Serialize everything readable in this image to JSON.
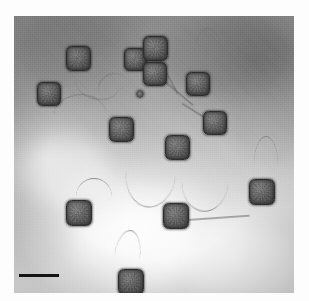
{
  "figure": {
    "domain": "Natural-Image",
    "kind": "transmission-electron-micrograph",
    "caption": ""
  },
  "plate": {
    "left": 14,
    "top": 16,
    "width": 280,
    "height": 277,
    "background_color": "#9e9e9e",
    "bright_region_color": "#efefef",
    "dark_region_color": "#8a8a8a",
    "page_margin_color": "#fdfdfd"
  },
  "scale_bar": {
    "label": "",
    "color": "#141414",
    "left": 19,
    "top": 274,
    "length_px": 40,
    "thickness_px": 3
  },
  "particle_count": 14,
  "particles": [
    {
      "id": "virion-1",
      "cx": 64,
      "cy": 42,
      "r": 12.5,
      "tail": {
        "type": "curve",
        "left": 62,
        "top": 48,
        "w": 44,
        "h": 30,
        "rot": 12
      }
    },
    {
      "id": "virion-2",
      "cx": 35,
      "cy": 78,
      "r": 12.0,
      "tail": {
        "type": "curve-up",
        "left": 40,
        "top": 80,
        "w": 52,
        "h": 38,
        "rot": -4
      }
    },
    {
      "id": "virion-3",
      "cx": 121,
      "cy": 43,
      "r": 11.5,
      "tail": {
        "type": "curve",
        "left": 112,
        "top": 50,
        "w": 30,
        "h": 26,
        "rot": 150
      }
    },
    {
      "id": "virion-4",
      "cx": 141,
      "cy": 32,
      "r": 12.5,
      "tail": {
        "type": "line",
        "left": 145,
        "top": 42,
        "w": 40,
        "h": 2,
        "rot": 62
      }
    },
    {
      "id": "virion-5",
      "cx": 141,
      "cy": 58,
      "r": 12.0,
      "tail": {
        "type": "line",
        "left": 150,
        "top": 64,
        "w": 38,
        "h": 2,
        "rot": 40
      }
    },
    {
      "id": "virion-6",
      "cx": 184,
      "cy": 68,
      "r": 12.0,
      "tail": {
        "type": "curve-up",
        "left": 180,
        "top": 12,
        "w": 28,
        "h": 56,
        "rot": 0
      }
    },
    {
      "id": "virion-7",
      "cx": 107,
      "cy": 113,
      "r": 12.5,
      "tail": {
        "type": "curve",
        "left": 112,
        "top": 120,
        "w": 50,
        "h": 68,
        "rot": 6
      }
    },
    {
      "id": "virion-8",
      "cx": 163,
      "cy": 131,
      "r": 12.5,
      "tail": {
        "type": "curve",
        "left": 168,
        "top": 136,
        "w": 46,
        "h": 58,
        "rot": 2
      }
    },
    {
      "id": "virion-9",
      "cx": 201,
      "cy": 107,
      "r": 12.0,
      "tail": {
        "type": "line",
        "left": 190,
        "top": 100,
        "w": 26,
        "h": 2,
        "rot": 212
      }
    },
    {
      "id": "virion-10",
      "cx": 65,
      "cy": 197,
      "r": 13.0,
      "tail": {
        "type": "curve-up",
        "left": 62,
        "top": 162,
        "w": 36,
        "h": 36,
        "rot": 0
      }
    },
    {
      "id": "virion-11",
      "cx": 162,
      "cy": 200,
      "r": 13.0,
      "tail": {
        "type": "line",
        "left": 174,
        "top": 203,
        "w": 62,
        "h": 2,
        "rot": -4
      }
    },
    {
      "id": "virion-12",
      "cx": 248,
      "cy": 176,
      "r": 13.0,
      "tail": {
        "type": "curve-up",
        "left": 240,
        "top": 120,
        "w": 24,
        "h": 56,
        "rot": 0
      }
    },
    {
      "id": "virion-13",
      "cx": 117,
      "cy": 266,
      "r": 13.0,
      "tail": {
        "type": "curve-up",
        "left": 100,
        "top": 212,
        "w": 26,
        "h": 56,
        "rot": 8
      }
    },
    {
      "id": "virion-14",
      "cx": 126,
      "cy": 78,
      "r": 4.0,
      "tail": null
    }
  ],
  "blotches": [
    {
      "left": 8,
      "top": 120,
      "w": 90,
      "h": 70,
      "color": "rgba(255,255,255,0.38)"
    },
    {
      "left": 60,
      "top": 190,
      "w": 120,
      "h": 80,
      "color": "rgba(255,255,255,0.42)"
    },
    {
      "left": 170,
      "top": 210,
      "w": 110,
      "h": 70,
      "color": "rgba(255,255,255,0.30)"
    },
    {
      "left": 150,
      "top": 0,
      "w": 130,
      "h": 80,
      "color": "rgba(105,105,105,0.32)"
    },
    {
      "left": 0,
      "top": 0,
      "w": 110,
      "h": 70,
      "color": "rgba(115,115,115,0.26)"
    },
    {
      "left": 90,
      "top": 100,
      "w": 100,
      "h": 70,
      "color": "rgba(200,200,200,0.22)"
    },
    {
      "left": 215,
      "top": 60,
      "w": 80,
      "h": 90,
      "color": "rgba(130,130,130,0.22)"
    },
    {
      "left": 30,
      "top": 240,
      "w": 100,
      "h": 50,
      "color": "rgba(235,235,235,0.30)"
    }
  ]
}
